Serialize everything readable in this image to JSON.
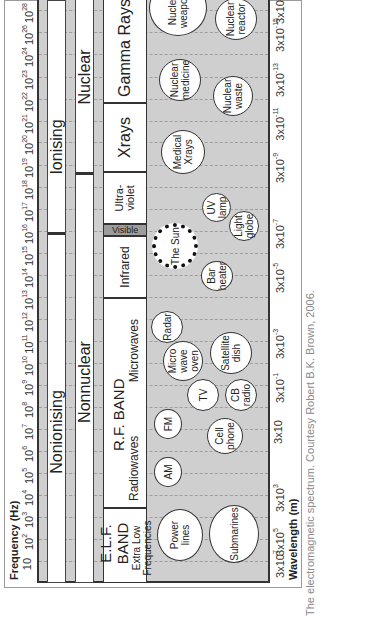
{
  "figure": {
    "frequency_axis": {
      "title": "Frequency (Hz)",
      "ticks": [
        {
          "base": "10",
          "exp": "",
          "pos": 19
        },
        {
          "base": "10",
          "exp": "2",
          "pos": 41
        },
        {
          "base": "10",
          "exp": "3",
          "pos": 63
        },
        {
          "base": "10",
          "exp": "4",
          "pos": 85
        },
        {
          "base": "10",
          "exp": "5",
          "pos": 107
        },
        {
          "base": "10",
          "exp": "6",
          "pos": 129
        },
        {
          "base": "10",
          "exp": "7",
          "pos": 151
        },
        {
          "base": "10",
          "exp": "8",
          "pos": 173
        },
        {
          "base": "10",
          "exp": "9",
          "pos": 195
        },
        {
          "base": "10",
          "exp": "10",
          "pos": 217
        },
        {
          "base": "10",
          "exp": "11",
          "pos": 239
        },
        {
          "base": "10",
          "exp": "12",
          "pos": 261
        },
        {
          "base": "10",
          "exp": "13",
          "pos": 283
        },
        {
          "base": "10",
          "exp": "14",
          "pos": 305
        },
        {
          "base": "10",
          "exp": "15",
          "pos": 327
        },
        {
          "base": "10",
          "exp": "16",
          "pos": 349
        },
        {
          "base": "10",
          "exp": "17",
          "pos": 371
        },
        {
          "base": "10",
          "exp": "18",
          "pos": 393
        },
        {
          "base": "10",
          "exp": "19",
          "pos": 415
        },
        {
          "base": "10",
          "exp": "20",
          "pos": 438
        },
        {
          "base": "10",
          "exp": "21",
          "pos": 459
        },
        {
          "base": "10",
          "exp": "22",
          "pos": 481
        },
        {
          "base": "10",
          "exp": "23",
          "pos": 503
        },
        {
          "base": "10",
          "exp": "24",
          "pos": 526
        },
        {
          "base": "10",
          "exp": "26",
          "pos": 548
        },
        {
          "base": "10",
          "exp": "28",
          "pos": 570
        }
      ]
    },
    "wavelength_axis": {
      "title": "Wavelength (m)",
      "ticks": [
        {
          "base": "3x10",
          "exp": "7",
          "pos": 19
        },
        {
          "base": "3x10",
          "exp": "5",
          "pos": 41
        },
        {
          "base": "3x10",
          "exp": "3",
          "pos": 85
        },
        {
          "base": "3x10",
          "exp": "",
          "pos": 151
        },
        {
          "base": "3x10",
          "exp": "-1",
          "pos": 195
        },
        {
          "base": "3x10",
          "exp": "-3",
          "pos": 239
        },
        {
          "base": "3x10",
          "exp": "-5",
          "pos": 305
        },
        {
          "base": "3x10",
          "exp": "-7",
          "pos": 349
        },
        {
          "base": "3x10",
          "exp": "-9",
          "pos": 415
        },
        {
          "base": "3x10",
          "exp": "-11",
          "pos": 459
        },
        {
          "base": "3x10",
          "exp": "-13",
          "pos": 503
        },
        {
          "base": "3x10",
          "exp": "-15",
          "pos": 548
        },
        {
          "base": "3x10",
          "exp": "-17",
          "pos": 576
        }
      ]
    },
    "ionising_row": {
      "left": "Nonionising",
      "right": "Ionising"
    },
    "nuclear_row": {
      "left": "Nonnuclear",
      "right": "Nuclear"
    },
    "bands": {
      "elf_title": "E.L.F. BAND",
      "elf_sub": "Extra Low Frequencies",
      "rf_title": "R.F. BAND",
      "radiowaves": "Radiowaves",
      "microwaves": "Microwaves",
      "infrared": "Infrared",
      "visible": "Visible",
      "ultraviolet": "Ultra-violet",
      "xrays": "Xrays",
      "gamma": "Gamma Rays"
    },
    "sources": {
      "power_lines": "Power lines",
      "submarines": "Submarines",
      "am": "AM",
      "fm": "FM",
      "cell_phone": "Cell phone",
      "tv": "TV",
      "cb_radio": "CB radio",
      "microwave_oven": "Micro wave oven",
      "satellite_dish": "Satellite dish",
      "radar": "Radar",
      "bar_heater": "Bar heater",
      "the_sun": "The Sun",
      "light_globe": "Light globe",
      "uv_lamp": "UV lamp",
      "medical_xrays": "Medical Xrays",
      "nuclear_medicine": "Nuclear medicine",
      "nuclear_waste": "Nuclear waste",
      "nuclear_reactor": "Nuclear reactor",
      "nuclear_weapons": "Nuclear weapons"
    }
  },
  "caption": "The electromagnetic spectrum. Courtesy Robert B.K. Brown, 2006."
}
